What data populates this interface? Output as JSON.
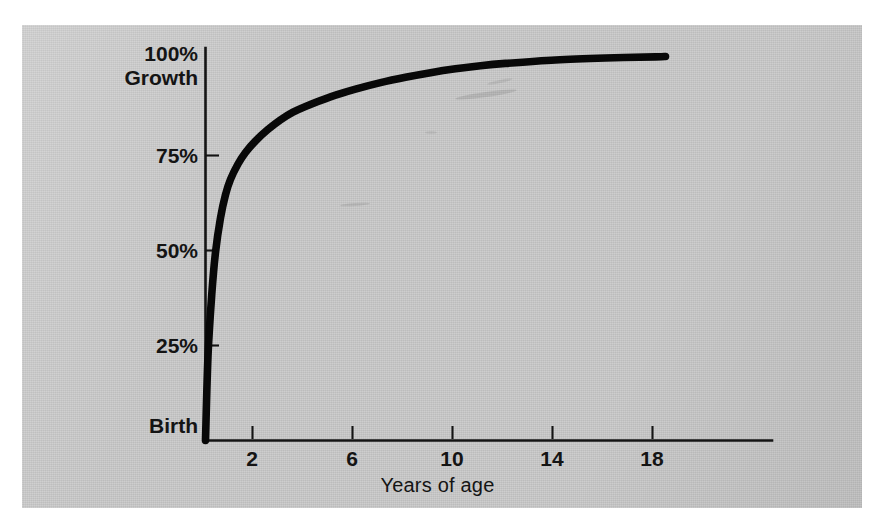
{
  "figure": {
    "background_color": "#ffffff",
    "panel_color": "#c9c9c9",
    "ink_color": "#141414"
  },
  "chart_data": {
    "type": "line",
    "title": "",
    "subtitle": "",
    "xlabel": "Years of age",
    "ylabel": "100% Growth",
    "ylabel_lines": [
      "100%",
      "Growth"
    ],
    "grid": false,
    "legend": "none",
    "xlim": [
      0,
      20.5
    ],
    "ylim": [
      0,
      104
    ],
    "xticks": [
      2,
      6,
      10,
      14,
      18
    ],
    "xtick_labels": [
      "2",
      "6",
      "10",
      "14",
      "18"
    ],
    "yticks": [
      0,
      25,
      50,
      75,
      100
    ],
    "ytick_labels": [
      "Birth",
      "25%",
      "50%",
      "75%",
      "100%"
    ],
    "x_origin_label": "Birth",
    "series": [
      {
        "name": "Brain growth",
        "x": [
          0,
          0.1,
          0.25,
          0.4,
          0.6,
          0.8,
          1.0,
          1.3,
          1.6,
          2.0,
          2.5,
          3.0,
          3.5,
          4.0,
          5.0,
          6.0,
          7.0,
          8.0,
          9.0,
          10.0,
          11.0,
          12.0,
          14.0,
          16.0,
          18.0,
          18.4
        ],
        "y": [
          0,
          22,
          38,
          49,
          58,
          64,
          68,
          72,
          75,
          78,
          81,
          83.5,
          85.5,
          87,
          89.5,
          91.5,
          93.2,
          94.6,
          95.8,
          96.8,
          97.6,
          98.2,
          99.1,
          99.6,
          99.9,
          100
        ]
      }
    ],
    "annotations": []
  },
  "axis": {
    "y_labels": [
      {
        "name": "ylabel-100-growth",
        "text_line1": "100%",
        "text_line2": "Growth"
      },
      {
        "name": "ylabel-75",
        "text": "75%"
      },
      {
        "name": "ylabel-50",
        "text": "50%"
      },
      {
        "name": "ylabel-25",
        "text": "25%"
      },
      {
        "name": "ylabel-birth",
        "text": "Birth"
      }
    ],
    "x_labels": [
      {
        "name": "xtick-2",
        "text": "2"
      },
      {
        "name": "xtick-6",
        "text": "6"
      },
      {
        "name": "xtick-10",
        "text": "10"
      },
      {
        "name": "xtick-14",
        "text": "14"
      },
      {
        "name": "xtick-18",
        "text": "18"
      }
    ],
    "x_axis_title": "Years of age"
  }
}
